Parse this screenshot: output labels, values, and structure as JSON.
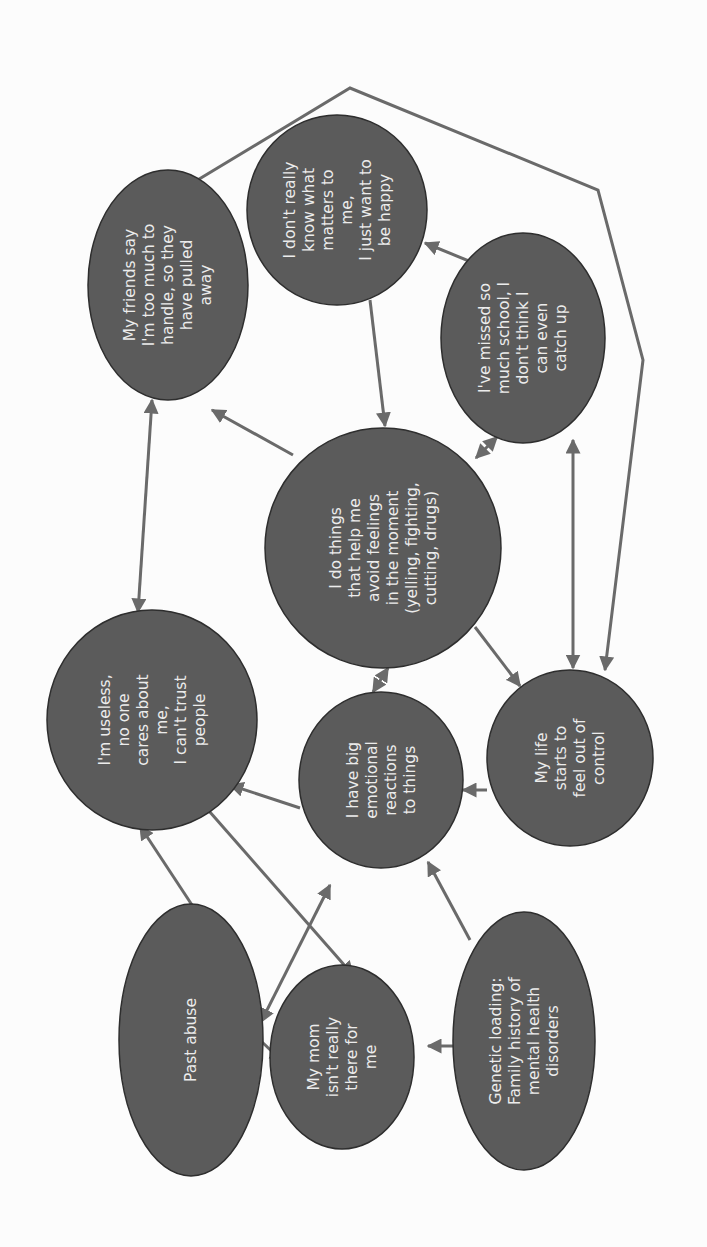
{
  "diagram": {
    "type": "cause-effect concept map",
    "orientation": "rotated 90deg counter-clockwise (text reads bottom-to-top)",
    "colors": {
      "node_fill": "#5b5b5b",
      "node_stroke": "#2e2e2e",
      "node_text": "#ececec",
      "edge": "#6a6a6a",
      "background": "#fcfcfc"
    },
    "nodes": [
      {
        "id": "friends",
        "cx": 168,
        "cy": 285,
        "rx": 80,
        "ry": 115,
        "lines": [
          "My friends say",
          "I'm too much to",
          "handle, so they",
          "have pulled",
          "away"
        ]
      },
      {
        "id": "dont_know",
        "cx": 337,
        "cy": 210,
        "rx": 90,
        "ry": 95,
        "lines": [
          "I don't really",
          "know what",
          "matters to",
          "me,",
          "I just want to",
          "be happy"
        ]
      },
      {
        "id": "missed_school",
        "cx": 523,
        "cy": 338,
        "rx": 82,
        "ry": 105,
        "lines": [
          "I've missed so",
          "much school, I",
          "don't think I",
          "can even",
          "catch up"
        ]
      },
      {
        "id": "avoid",
        "cx": 383,
        "cy": 548,
        "rx": 118,
        "ry": 120,
        "lines": [
          "I do things",
          "that help me",
          "avoid feelings",
          "in the moment",
          "(yelling, fighting,",
          "cutting, drugs)"
        ]
      },
      {
        "id": "useless",
        "cx": 152,
        "cy": 720,
        "rx": 105,
        "ry": 110,
        "lines": [
          "I'm useless,",
          "no one",
          "cares about",
          "me,",
          "I can't trust",
          "people"
        ]
      },
      {
        "id": "big_reactions",
        "cx": 381,
        "cy": 780,
        "rx": 82,
        "ry": 88,
        "lines": [
          "I have big",
          "emotional",
          "reactions",
          "to things"
        ]
      },
      {
        "id": "out_of_control",
        "cx": 570,
        "cy": 758,
        "rx": 83,
        "ry": 88,
        "lines": [
          "My life",
          "starts to",
          "feel out of",
          "control"
        ]
      },
      {
        "id": "past_abuse",
        "cx": 191,
        "cy": 1040,
        "rx": 72,
        "ry": 136,
        "lines": [
          "Past abuse"
        ]
      },
      {
        "id": "mom",
        "cx": 342,
        "cy": 1057,
        "rx": 72,
        "ry": 92,
        "lines": [
          "My mom",
          "isn't really",
          "there for",
          "me"
        ]
      },
      {
        "id": "genetic",
        "cx": 524,
        "cy": 1041,
        "rx": 71,
        "ry": 129,
        "lines": [
          "Genetic loading:",
          "Family history of",
          "mental health",
          "disorders"
        ]
      }
    ],
    "edges": [
      {
        "from": "avoid",
        "to": "friends",
        "x1": 293,
        "y1": 455,
        "x2": 212,
        "y2": 410,
        "start_arrow": false,
        "end_arrow": true
      },
      {
        "from": "dont_know",
        "to": "avoid",
        "x1": 370,
        "y1": 300,
        "x2": 385,
        "y2": 426,
        "start_arrow": false,
        "end_arrow": true
      },
      {
        "from": "dont_know",
        "to": "missed_school",
        "x1": 425,
        "y1": 243,
        "x2": 486,
        "y2": 268,
        "start_arrow": true,
        "end_arrow": true
      },
      {
        "from": "avoid",
        "to": "missed_school",
        "x1": 476,
        "y1": 458,
        "x2": 497,
        "y2": 437,
        "start_arrow": true,
        "end_arrow": true
      },
      {
        "from": "friends",
        "to": "useless",
        "x1": 152,
        "y1": 400,
        "x2": 138,
        "y2": 612,
        "start_arrow": true,
        "end_arrow": true
      },
      {
        "from": "missed_school",
        "to": "out_of_control",
        "x1": 573,
        "y1": 440,
        "x2": 573,
        "y2": 668,
        "start_arrow": true,
        "end_arrow": true
      },
      {
        "from": "avoid",
        "to": "out_of_control",
        "x1": 475,
        "y1": 627,
        "x2": 520,
        "y2": 686,
        "start_arrow": false,
        "end_arrow": true
      },
      {
        "from": "avoid",
        "to": "big_reactions",
        "x1": 388,
        "y1": 668,
        "x2": 373,
        "y2": 692,
        "start_arrow": true,
        "end_arrow": true
      },
      {
        "from": "useless",
        "to": "big_reactions",
        "x1": 230,
        "y1": 785,
        "x2": 300,
        "y2": 808,
        "start_arrow": true,
        "end_arrow": false
      },
      {
        "from": "out_of_control",
        "to": "big_reactions",
        "x1": 487,
        "y1": 790,
        "x2": 463,
        "y2": 790,
        "start_arrow": false,
        "end_arrow": true
      },
      {
        "from": "past_abuse",
        "to": "useless",
        "x1": 192,
        "y1": 905,
        "x2": 140,
        "y2": 826,
        "start_arrow": false,
        "end_arrow": true
      },
      {
        "from": "useless",
        "to": "mom",
        "x1": 202,
        "y1": 803,
        "x2": 353,
        "y2": 975,
        "start_arrow": false,
        "end_arrow": true
      },
      {
        "from": "past_abuse",
        "to": "big_reactions",
        "x1": 261,
        "y1": 1022,
        "x2": 330,
        "y2": 885,
        "start_arrow": true,
        "end_arrow": true
      },
      {
        "from": "past_abuse",
        "to": "mom",
        "x1": 262,
        "y1": 1042,
        "x2": 283,
        "y2": 1062,
        "start_arrow": false,
        "end_arrow": true
      },
      {
        "from": "genetic",
        "to": "mom",
        "x1": 453,
        "y1": 1046,
        "x2": 428,
        "y2": 1046,
        "start_arrow": false,
        "end_arrow": true
      },
      {
        "from": "genetic",
        "to": "big_reactions",
        "x1": 470,
        "y1": 940,
        "x2": 428,
        "y2": 862,
        "start_arrow": false,
        "end_arrow": true
      }
    ],
    "loop": {
      "from": "friends",
      "to": "out_of_control",
      "points": "181,190 350,88 598,190 643,360 605,670",
      "end_arrow": true
    }
  }
}
